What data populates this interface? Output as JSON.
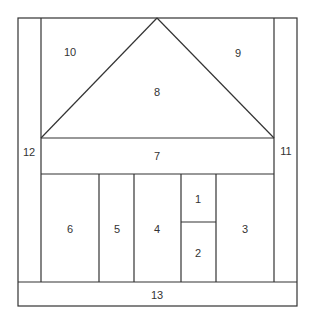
{
  "diagram": {
    "stroke_color": "#333333",
    "background": "#ffffff",
    "regions": [
      {
        "id": "1",
        "label": "1"
      },
      {
        "id": "2",
        "label": "2"
      },
      {
        "id": "3",
        "label": "3"
      },
      {
        "id": "4",
        "label": "4"
      },
      {
        "id": "5",
        "label": "5"
      },
      {
        "id": "6",
        "label": "6"
      },
      {
        "id": "7",
        "label": "7"
      },
      {
        "id": "8",
        "label": "8"
      },
      {
        "id": "9",
        "label": "9"
      },
      {
        "id": "10",
        "label": "10"
      },
      {
        "id": "11",
        "label": "11"
      },
      {
        "id": "12",
        "label": "12"
      },
      {
        "id": "13",
        "label": "13"
      }
    ]
  }
}
